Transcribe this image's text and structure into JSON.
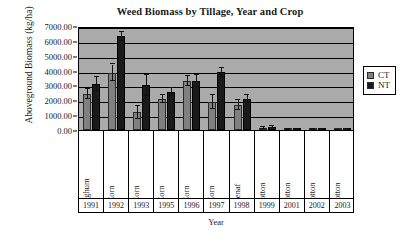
{
  "chart_data": {
    "type": "bar",
    "title": "Weed Biomass by Tillage, Year and Crop",
    "xlabel": "Year",
    "ylabel": "Aboveground Biomass (kg/ha)",
    "ylim": [
      0,
      7000
    ],
    "ytick_labels": [
      "0.00",
      "1000.00",
      "2000.00",
      "3000.00",
      "4000.00",
      "5000.00",
      "6000.00",
      "7000.00"
    ],
    "ytick_values": [
      0,
      1000,
      2000,
      3000,
      4000,
      5000,
      6000,
      7000
    ],
    "grid": true,
    "legend_position": "right",
    "plot_background": "#aaaaaa",
    "categories": [
      "1991",
      "1992",
      "1993",
      "1995",
      "1996",
      "1997",
      "1998",
      "1999",
      "2001",
      "2002",
      "2003"
    ],
    "crops": [
      "Sorghum",
      "Corn",
      "Corn",
      "Corn",
      "Corn",
      "Corn",
      "Kenaf",
      "Cotton",
      "Cotton",
      "Cotton",
      "Cotton"
    ],
    "series": [
      {
        "name": "CT",
        "color": "#808080",
        "values": [
          2400,
          3850,
          1200,
          2100,
          3300,
          1900,
          1700,
          150,
          30,
          20,
          15
        ],
        "errors": [
          330,
          560,
          440,
          260,
          310,
          470,
          340,
          60,
          20,
          15,
          10
        ]
      },
      {
        "name": "NT",
        "color": "#1a1a1a",
        "values": [
          3100,
          6300,
          3000,
          2550,
          3280,
          3880,
          2100,
          180,
          40,
          35,
          20
        ],
        "errors": [
          500,
          300,
          700,
          280,
          400,
          300,
          260,
          70,
          25,
          20,
          15
        ]
      }
    ]
  },
  "legend": {
    "items": [
      {
        "label": "CT",
        "color": "#808080"
      },
      {
        "label": "NT",
        "color": "#1a1a1a"
      }
    ]
  }
}
